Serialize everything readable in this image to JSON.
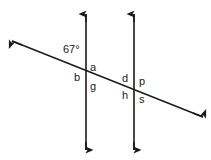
{
  "figure": {
    "width": 211,
    "height": 160,
    "background_color": "#ffffff",
    "stroke_color": "#1a1a1a",
    "text_color": "#1a1a1a"
  },
  "lines": {
    "vertical_left": {
      "name": "first-parallel-line",
      "x": 86,
      "y_top": 14,
      "y_bottom": 150,
      "arrow_top": true,
      "arrow_bottom": true
    },
    "vertical_right": {
      "name": "second-parallel-line",
      "x": 134,
      "y_top": 14,
      "y_bottom": 150,
      "arrow_top": true,
      "arrow_bottom": true
    },
    "transversal": {
      "name": "transversal-line",
      "x1": 12,
      "y1": 41,
      "x2": 203,
      "y2": 117,
      "arrow_start": true,
      "arrow_end": true
    }
  },
  "intersections": [
    {
      "name": "intersection-left",
      "x": 86,
      "y": 71.5
    },
    {
      "name": "intersection-right",
      "x": 134,
      "y": 90.6
    }
  ],
  "labels": {
    "angle_measure": "67°",
    "a": "a",
    "b": "b",
    "g": "g",
    "d": "d",
    "p": "p",
    "h": "h",
    "s": "s"
  }
}
